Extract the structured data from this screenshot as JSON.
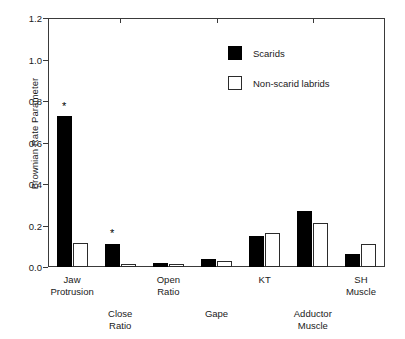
{
  "chart_data": {
    "type": "bar",
    "title": "",
    "xlabel": "",
    "ylabel": "Brownian Rate Parameter",
    "ylim": [
      0.0,
      1.2
    ],
    "yticks": [
      "0.0",
      "0.2",
      "0.4",
      "0.6",
      "0.8",
      "1.0",
      "1.2"
    ],
    "ytick_values": [
      0.0,
      0.2,
      0.4,
      0.6,
      0.8,
      1.0,
      1.2
    ],
    "grid": false,
    "legend_position": "upper-center-right",
    "categories": [
      "Jaw Protrusion",
      "Close Ratio",
      "Open Ratio",
      "Gape",
      "KT",
      "Adductor Muscle",
      "SH Muscle"
    ],
    "category_lines": [
      [
        "Jaw",
        "Protrusion"
      ],
      [
        "Close",
        "Ratio"
      ],
      [
        "Open",
        "Ratio"
      ],
      [
        "Gape",
        ""
      ],
      [
        "KT",
        ""
      ],
      [
        "Adductor",
        "Muscle"
      ],
      [
        "SH",
        "Muscle"
      ]
    ],
    "category_rows": [
      "top",
      "bottom",
      "top",
      "bottom",
      "top",
      "bottom",
      "top"
    ],
    "series": [
      {
        "name": "Scarids",
        "color": "#000000",
        "values": [
          0.73,
          0.11,
          0.017,
          0.037,
          0.148,
          0.27,
          0.063
        ]
      },
      {
        "name": "Non-scarid labrids",
        "color": "#ffffff",
        "values": [
          0.115,
          0.015,
          0.013,
          0.028,
          0.162,
          0.21,
          0.11
        ]
      }
    ],
    "annotations": [
      {
        "label": "*",
        "category": "Jaw Protrusion",
        "series": "Scarids",
        "value": 0.8
      },
      {
        "label": "*",
        "category": "Close Ratio",
        "series": "Scarids",
        "value": 0.19
      }
    ]
  },
  "legend": {
    "items": [
      {
        "label": "Scarids",
        "swatch": "filled-black"
      },
      {
        "label": "Non-scarid labrids",
        "swatch": "open-white"
      }
    ]
  }
}
